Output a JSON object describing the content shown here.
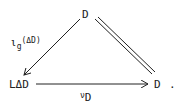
{
  "diagram": {
    "type": "commutative-triangle",
    "nodes": {
      "top": "D",
      "bottom_left": "LΔD",
      "bottom_right": "D",
      "trailing_punct": "."
    },
    "arrows": [
      {
        "from": "top",
        "to": "bottom_left",
        "style": "single-arrow",
        "label_main": "ι",
        "label_sub": "g",
        "label_arg": "(ΔD)"
      },
      {
        "from": "top",
        "to": "bottom_right",
        "style": "double-line-equality"
      },
      {
        "from": "bottom_left",
        "to": "bottom_right",
        "style": "single-arrow",
        "label_main": "ν",
        "label_sub": "D"
      }
    ]
  }
}
